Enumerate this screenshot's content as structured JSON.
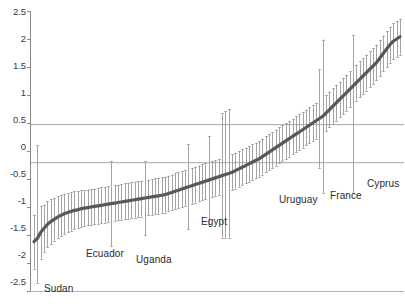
{
  "chart_data": {
    "type": "scatter",
    "title": "",
    "subtitle": "",
    "xlabel": "",
    "ylabel": "",
    "ylim": [
      -2.5,
      2.5
    ],
    "yticks": [
      -2.5,
      -2,
      -1.5,
      -1,
      -0.5,
      0,
      0.5,
      1,
      1.5,
      2,
      2.5
    ],
    "ytick_labels": [
      "-2.5",
      "-2",
      "-1.5",
      "-1",
      "-0.5",
      "0",
      "0.5",
      "1",
      "1.5",
      "2",
      "2.5"
    ],
    "grid": false,
    "legend": null,
    "reference_lines": [
      {
        "value": 0.48,
        "orientation": "horizontal",
        "color": "#a8a8a8"
      },
      {
        "value": -0.2,
        "orientation": "horizontal",
        "color": "#a8a8a8"
      }
    ],
    "annotated_points": [
      {
        "label": "Sudan",
        "index": 1
      },
      {
        "label": "Ecuador",
        "index": 23
      },
      {
        "label": "Uganda",
        "index": 33
      },
      {
        "label": "Egypt",
        "index": 57
      },
      {
        "label": "Uruguay",
        "index": 86
      },
      {
        "label": "France",
        "index": 96
      },
      {
        "label": "Cyprus",
        "index": 108
      }
    ],
    "series": [
      {
        "name": "point estimate",
        "color": "#585858",
        "values": [
          -1.62,
          -1.56,
          -1.45,
          -1.38,
          -1.31,
          -1.26,
          -1.22,
          -1.18,
          -1.15,
          -1.12,
          -1.1,
          -1.08,
          -1.06,
          -1.05,
          -1.03,
          -1.02,
          -1.01,
          -1.0,
          -0.99,
          -0.98,
          -0.97,
          -0.96,
          -0.95,
          -0.94,
          -0.93,
          -0.92,
          -0.91,
          -0.9,
          -0.89,
          -0.88,
          -0.87,
          -0.86,
          -0.85,
          -0.84,
          -0.83,
          -0.82,
          -0.81,
          -0.8,
          -0.79,
          -0.78,
          -0.76,
          -0.74,
          -0.72,
          -0.7,
          -0.68,
          -0.66,
          -0.64,
          -0.62,
          -0.6,
          -0.58,
          -0.56,
          -0.54,
          -0.52,
          -0.5,
          -0.48,
          -0.46,
          -0.44,
          -0.42,
          -0.4,
          -0.38,
          -0.35,
          -0.32,
          -0.29,
          -0.26,
          -0.23,
          -0.2,
          -0.17,
          -0.14,
          -0.1,
          -0.06,
          -0.02,
          0.02,
          0.06,
          0.1,
          0.14,
          0.18,
          0.22,
          0.26,
          0.3,
          0.34,
          0.38,
          0.42,
          0.46,
          0.5,
          0.54,
          0.58,
          0.62,
          0.68,
          0.74,
          0.8,
          0.86,
          0.92,
          0.98,
          1.04,
          1.1,
          1.16,
          1.22,
          1.28,
          1.34,
          1.4,
          1.46,
          1.52,
          1.58,
          1.66,
          1.74,
          1.82,
          1.9,
          1.96,
          2.0,
          2.04
        ]
      },
      {
        "name": "ci_lower",
        "color": "#9a9a9a",
        "values": [
          -2.1,
          -2.35,
          -1.92,
          -1.8,
          -1.72,
          -1.66,
          -1.6,
          -1.55,
          -1.52,
          -1.48,
          -1.45,
          -1.42,
          -1.4,
          -1.38,
          -1.36,
          -1.34,
          -1.33,
          -1.32,
          -1.31,
          -1.3,
          -1.29,
          -1.28,
          -1.27,
          -1.7,
          -1.25,
          -1.24,
          -1.23,
          -1.22,
          -1.21,
          -1.2,
          -1.19,
          -1.18,
          -1.17,
          -1.5,
          -1.15,
          -1.14,
          -1.13,
          -1.12,
          -1.11,
          -1.1,
          -1.08,
          -1.06,
          -1.04,
          -1.02,
          -1.0,
          -0.98,
          -1.4,
          -0.94,
          -0.92,
          -0.9,
          -0.88,
          -0.86,
          -1.3,
          -0.82,
          -0.8,
          -0.78,
          -1.55,
          -1.55,
          -1.55,
          -0.7,
          -0.67,
          -0.64,
          -0.61,
          -0.58,
          -0.55,
          -0.52,
          -0.49,
          -0.46,
          -0.42,
          -0.38,
          -0.34,
          -0.3,
          -0.26,
          -0.22,
          -0.18,
          -0.14,
          -0.1,
          -0.06,
          -0.02,
          0.02,
          0.06,
          0.1,
          0.14,
          0.18,
          0.22,
          -0.3,
          -0.75,
          0.36,
          0.42,
          0.48,
          0.54,
          0.6,
          0.66,
          0.72,
          0.78,
          -0.75,
          0.9,
          0.96,
          1.02,
          1.08,
          1.14,
          1.2,
          1.26,
          1.34,
          1.42,
          1.5,
          1.58,
          1.64,
          1.68,
          1.72
        ]
      },
      {
        "name": "ci_upper",
        "color": "#9a9a9a",
        "values": [
          -1.14,
          0.1,
          -0.98,
          -0.96,
          -0.9,
          -0.86,
          -0.84,
          -0.81,
          -0.78,
          -0.76,
          -0.75,
          -0.74,
          -0.72,
          -0.72,
          -0.7,
          -0.7,
          -0.69,
          -0.68,
          -0.67,
          -0.66,
          -0.65,
          -0.64,
          -0.63,
          -0.18,
          -0.61,
          -0.6,
          -0.59,
          -0.58,
          -0.57,
          -0.56,
          -0.55,
          -0.54,
          -0.53,
          -0.18,
          -0.51,
          -0.5,
          -0.49,
          -0.48,
          -0.47,
          -0.46,
          -0.44,
          -0.42,
          -0.4,
          -0.38,
          -0.36,
          -0.34,
          0.12,
          -0.3,
          -0.28,
          -0.26,
          -0.24,
          -0.22,
          0.26,
          -0.18,
          -0.16,
          -0.14,
          0.67,
          0.71,
          0.75,
          -0.06,
          -0.03,
          0.0,
          0.03,
          0.06,
          0.09,
          0.12,
          0.15,
          0.18,
          0.22,
          0.26,
          0.3,
          0.34,
          0.38,
          0.42,
          0.46,
          0.5,
          0.54,
          0.58,
          0.62,
          0.66,
          0.7,
          0.74,
          0.78,
          0.82,
          0.86,
          1.46,
          1.99,
          1.0,
          1.06,
          1.12,
          1.18,
          1.24,
          1.3,
          1.36,
          1.42,
          2.07,
          1.54,
          1.6,
          1.66,
          1.72,
          1.78,
          1.84,
          1.9,
          1.98,
          2.06,
          2.14,
          2.22,
          2.28,
          2.32,
          2.36
        ]
      }
    ]
  },
  "axis": {
    "y_labels": [
      "2.5",
      "2",
      "1.5",
      "1",
      "0.5",
      "0",
      "-0.5",
      "-1",
      "-1.5",
      "-2",
      "-2.5"
    ]
  },
  "labels": {
    "sudan": "Sudan",
    "ecuador": "Ecuador",
    "uganda": "Uganda",
    "egypt": "Egypt",
    "uruguay": "Uruguay",
    "france": "France",
    "cyprus": "Cyprus"
  }
}
